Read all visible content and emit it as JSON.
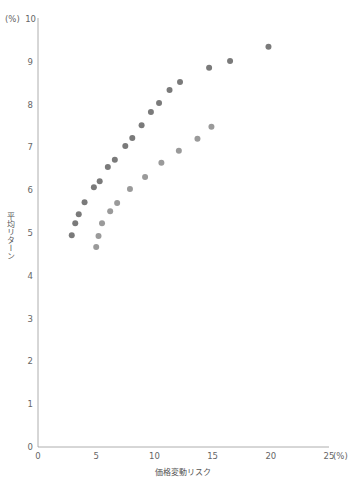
{
  "chart_data": {
    "type": "scatter",
    "title": "",
    "xlabel": "価格変動リスク",
    "ylabel": "平均リターン",
    "x_unit": "(%)",
    "y_unit": "(%)",
    "xlim": [
      0,
      25
    ],
    "ylim": [
      0,
      10
    ],
    "x_ticks": [
      "0",
      "5",
      "10",
      "15",
      "20",
      "25"
    ],
    "y_ticks": [
      "0",
      "1",
      "2",
      "3",
      "4",
      "5",
      "6",
      "7",
      "8",
      "9",
      "10"
    ],
    "grid": false,
    "legend": null,
    "series": [
      {
        "name": "upper",
        "color": "#7a7a7a",
        "points": [
          [
            2.9,
            4.95
          ],
          [
            3.2,
            5.23
          ],
          [
            3.5,
            5.44
          ],
          [
            4.0,
            5.72
          ],
          [
            4.8,
            6.07
          ],
          [
            5.3,
            6.21
          ],
          [
            6.0,
            6.54
          ],
          [
            6.6,
            6.71
          ],
          [
            7.5,
            7.03
          ],
          [
            8.1,
            7.22
          ],
          [
            8.9,
            7.52
          ],
          [
            9.7,
            7.83
          ],
          [
            10.4,
            8.04
          ],
          [
            11.3,
            8.34
          ],
          [
            12.2,
            8.53
          ],
          [
            14.7,
            8.86
          ],
          [
            16.5,
            9.02
          ],
          [
            19.8,
            9.35
          ]
        ]
      },
      {
        "name": "lower",
        "color": "#9a9a9a",
        "points": [
          [
            5.0,
            4.67
          ],
          [
            5.2,
            4.93
          ],
          [
            5.5,
            5.23
          ],
          [
            6.2,
            5.51
          ],
          [
            6.8,
            5.7
          ],
          [
            7.9,
            6.03
          ],
          [
            9.2,
            6.31
          ],
          [
            10.6,
            6.64
          ],
          [
            12.1,
            6.92
          ],
          [
            13.7,
            7.2
          ],
          [
            14.9,
            7.48
          ]
        ]
      }
    ]
  }
}
